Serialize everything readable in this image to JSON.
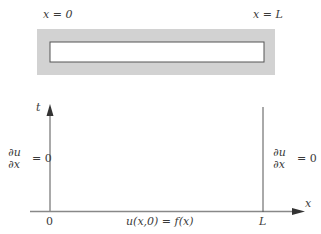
{
  "rod": {
    "left_label": "x = 0",
    "right_label": "x = L",
    "insulation_color": "#d2d2d2",
    "rod_fill": "#ffffff",
    "rod_stroke": "#555555"
  },
  "axes": {
    "t_label": "t",
    "x_label": "x",
    "origin_label": "0",
    "L_label": "L",
    "axis_color": "#555555"
  },
  "boundary": {
    "left": {
      "numerator": "∂u",
      "denominator": "∂x",
      "rhs": "= 0"
    },
    "right": {
      "numerator": "∂u",
      "denominator": "∂x",
      "rhs": "= 0"
    }
  },
  "initial_condition": "u(x,0) = f(x)"
}
